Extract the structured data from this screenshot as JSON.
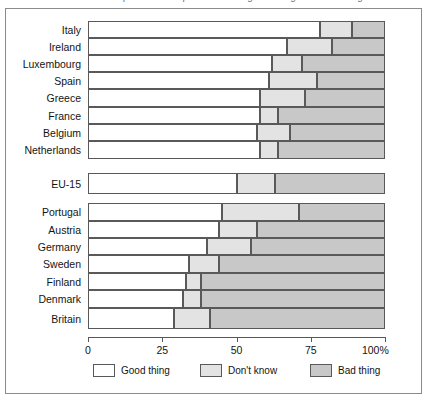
{
  "chart_data": {
    "type": "bar",
    "orientation": "horizontal",
    "stacked": true,
    "normalized_percent": true,
    "title": "Is membership of the European Union a good thing or a bad thing?",
    "xlabel": "",
    "ylabel": "",
    "xlim": [
      0,
      100
    ],
    "xticks": [
      0,
      25,
      50,
      75,
      100
    ],
    "xtick_labels": [
      "0",
      "25",
      "50",
      "75",
      "100%"
    ],
    "grid": false,
    "legend_position": "bottom",
    "categories": [
      "Italy",
      "Ireland",
      "Luxembourg",
      "Spain",
      "Greece",
      "France",
      "Belgium",
      "Netherlands",
      "EU-15",
      "Portugal",
      "Austria",
      "Germany",
      "Sweden",
      "Finland",
      "Denmark",
      "Britain"
    ],
    "series": [
      {
        "name": "Good thing",
        "color": "#ffffff",
        "values": [
          78,
          67,
          62,
          61,
          58,
          58,
          57,
          58,
          50,
          45,
          44,
          40,
          34,
          33,
          32,
          29
        ]
      },
      {
        "name": "Don't know",
        "color": "#e3e3e3",
        "values": [
          11,
          15,
          10,
          16,
          15,
          6,
          11,
          6,
          13,
          26,
          13,
          15,
          10,
          5,
          6,
          12
        ]
      },
      {
        "name": "Bad thing",
        "color": "#c8c8c8",
        "values": [
          11,
          18,
          28,
          23,
          27,
          36,
          32,
          36,
          37,
          29,
          43,
          45,
          56,
          62,
          62,
          59
        ]
      }
    ],
    "groups": [
      {
        "name": "above-average",
        "categories": [
          "Italy",
          "Ireland",
          "Luxembourg",
          "Spain",
          "Greece",
          "France",
          "Belgium",
          "Netherlands"
        ]
      },
      {
        "name": "eu-average",
        "categories": [
          "EU-15"
        ]
      },
      {
        "name": "below-average",
        "categories": [
          "Portugal",
          "Austria",
          "Germany",
          "Sweden",
          "Finland",
          "Denmark",
          "Britain"
        ]
      }
    ]
  },
  "legend": {
    "items": [
      {
        "label": "Good thing",
        "color": "#ffffff"
      },
      {
        "label": "Don't know",
        "color": "#e3e3e3"
      },
      {
        "label": "Bad thing",
        "color": "#c8c8c8"
      }
    ]
  }
}
